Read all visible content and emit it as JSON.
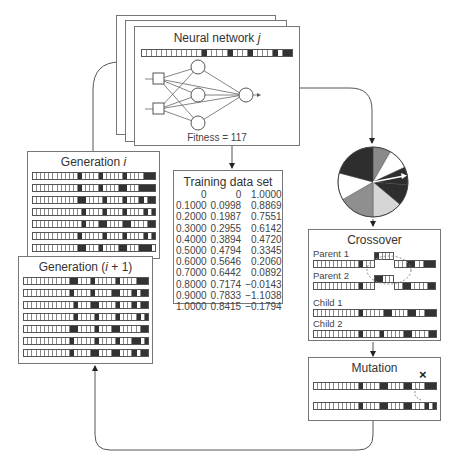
{
  "neural_network": {
    "title": "Neural network j",
    "title_prefix": "Neural network ",
    "title_var": "j",
    "fitness_label": "Fitness = 117",
    "chromosome": [
      0,
      0,
      0,
      0,
      0,
      0,
      0,
      0,
      0,
      0,
      0,
      0,
      1,
      0,
      0,
      0,
      0,
      1,
      0,
      0,
      0,
      1,
      0,
      0,
      0,
      0,
      1,
      0,
      1,
      1
    ]
  },
  "training_data": {
    "title": "Training data set",
    "rows": [
      [
        "0",
        "0",
        "1.0000"
      ],
      [
        "0.1000",
        "0.0998",
        "0.8869"
      ],
      [
        "0.2000",
        "0.1987",
        "0.7551"
      ],
      [
        "0.3000",
        "0.2955",
        "0.6142"
      ],
      [
        "0.4000",
        "0.3894",
        "0.4720"
      ],
      [
        "0.5000",
        "0.4794",
        "0.3345"
      ],
      [
        "0.6000",
        "0.5646",
        "0.2060"
      ],
      [
        "0.7000",
        "0.6442",
        "0.0892"
      ],
      [
        "0.8000",
        "0.7174",
        "−0.0143"
      ],
      [
        "0.9000",
        "0.7833",
        "−1.1038"
      ],
      [
        "1.0000",
        "0.8415",
        "−0.1794"
      ]
    ]
  },
  "generation_i": {
    "title_prefix": "Generation ",
    "title_var": "i",
    "title_suffix": "",
    "rows": [
      [
        0,
        0,
        0,
        0,
        0,
        0,
        0,
        0,
        0,
        0,
        0,
        1,
        0,
        0,
        0,
        0,
        1,
        0,
        0,
        0,
        0,
        0,
        1,
        0,
        0,
        0,
        0,
        1,
        1,
        1
      ],
      [
        0,
        0,
        0,
        0,
        0,
        0,
        0,
        0,
        0,
        0,
        0,
        1,
        0,
        0,
        0,
        0,
        1,
        0,
        0,
        0,
        0,
        1,
        1,
        0,
        0,
        0,
        1,
        1,
        1,
        1
      ],
      [
        0,
        0,
        0,
        0,
        0,
        0,
        0,
        0,
        0,
        0,
        0,
        1,
        1,
        0,
        0,
        0,
        0,
        1,
        0,
        0,
        0,
        0,
        1,
        0,
        0,
        0,
        1,
        0,
        1,
        1
      ],
      [
        0,
        0,
        0,
        0,
        0,
        0,
        0,
        0,
        0,
        0,
        0,
        0,
        1,
        0,
        0,
        0,
        0,
        1,
        0,
        0,
        0,
        0,
        1,
        0,
        0,
        0,
        0,
        1,
        0,
        1
      ],
      [
        0,
        0,
        0,
        0,
        0,
        0,
        0,
        0,
        0,
        0,
        0,
        0,
        1,
        0,
        0,
        0,
        1,
        1,
        0,
        0,
        0,
        0,
        1,
        1,
        0,
        0,
        0,
        0,
        1,
        1
      ],
      [
        0,
        0,
        0,
        0,
        0,
        0,
        0,
        0,
        0,
        0,
        0,
        1,
        0,
        0,
        0,
        0,
        0,
        1,
        0,
        0,
        0,
        0,
        1,
        0,
        0,
        0,
        0,
        1,
        0,
        1
      ],
      [
        0,
        0,
        0,
        0,
        0,
        0,
        0,
        0,
        0,
        0,
        0,
        1,
        1,
        0,
        0,
        0,
        1,
        0,
        0,
        0,
        0,
        1,
        1,
        0,
        0,
        0,
        1,
        1,
        1,
        0
      ]
    ]
  },
  "generation_i1": {
    "title_prefix": "Generation (",
    "title_var": "i",
    "title_suffix": " + 1)",
    "rows": [
      [
        0,
        0,
        0,
        0,
        0,
        0,
        0,
        0,
        0,
        0,
        0,
        1,
        1,
        0,
        0,
        0,
        1,
        0,
        0,
        0,
        0,
        0,
        1,
        0,
        0,
        0,
        0,
        1,
        1,
        1
      ],
      [
        0,
        0,
        0,
        0,
        0,
        0,
        0,
        0,
        0,
        0,
        0,
        1,
        0,
        0,
        0,
        0,
        1,
        0,
        0,
        0,
        0,
        1,
        1,
        0,
        0,
        0,
        1,
        0,
        1,
        1
      ],
      [
        0,
        0,
        0,
        0,
        0,
        0,
        0,
        0,
        0,
        0,
        0,
        0,
        1,
        0,
        0,
        0,
        1,
        1,
        0,
        0,
        0,
        0,
        1,
        0,
        0,
        0,
        1,
        0,
        1,
        1
      ],
      [
        0,
        0,
        0,
        0,
        0,
        0,
        0,
        0,
        0,
        0,
        0,
        0,
        1,
        0,
        0,
        0,
        0,
        1,
        0,
        0,
        0,
        0,
        1,
        0,
        0,
        0,
        0,
        1,
        0,
        1
      ],
      [
        0,
        0,
        0,
        0,
        0,
        0,
        0,
        0,
        0,
        0,
        0,
        1,
        1,
        0,
        0,
        0,
        0,
        1,
        0,
        0,
        0,
        1,
        1,
        0,
        0,
        0,
        0,
        0,
        1,
        1
      ],
      [
        0,
        0,
        0,
        0,
        0,
        0,
        0,
        0,
        0,
        0,
        0,
        1,
        0,
        0,
        0,
        0,
        0,
        1,
        0,
        0,
        0,
        0,
        1,
        0,
        0,
        0,
        1,
        1,
        0,
        1
      ],
      [
        0,
        0,
        0,
        0,
        0,
        0,
        0,
        0,
        0,
        0,
        0,
        1,
        0,
        0,
        0,
        0,
        1,
        1,
        0,
        0,
        0,
        1,
        1,
        0,
        0,
        0,
        1,
        0,
        1,
        1
      ]
    ]
  },
  "roulette_wheel": {
    "label": "Roulette wheel selection",
    "slices": [
      {
        "start": -90,
        "end": -60,
        "color": "#8a8a8a"
      },
      {
        "start": -60,
        "end": -25,
        "color": "#ffffff"
      },
      {
        "start": -25,
        "end": 5,
        "color": "#2e2e2e"
      },
      {
        "start": 5,
        "end": 40,
        "color": "#2e2e2e"
      },
      {
        "start": 40,
        "end": 90,
        "color": "#d6d6d6"
      },
      {
        "start": 90,
        "end": 150,
        "color": "#8f8f8f"
      },
      {
        "start": 150,
        "end": 195,
        "color": "#ffffff"
      },
      {
        "start": 195,
        "end": 270,
        "color": "#2e2e2e"
      }
    ]
  },
  "crossover": {
    "title": "Crossover",
    "parent1_label": "Parent 1",
    "parent2_label": "Parent 2",
    "child1_label": "Child 1",
    "child2_label": "Child 2",
    "child1": [
      0,
      0,
      0,
      0,
      0,
      0,
      0,
      0,
      0,
      0,
      0,
      1,
      0,
      0,
      0,
      0,
      0,
      1,
      1,
      0,
      0,
      0,
      0,
      1,
      1,
      0,
      0,
      1,
      1,
      1
    ],
    "child2": [
      0,
      0,
      0,
      0,
      0,
      0,
      0,
      0,
      0,
      0,
      0,
      1,
      0,
      0,
      0,
      0,
      1,
      0,
      0,
      0,
      0,
      0,
      1,
      1,
      0,
      0,
      0,
      0,
      1,
      1
    ]
  },
  "mutation": {
    "title": "Mutation",
    "mark": "×",
    "before": [
      0,
      0,
      0,
      0,
      0,
      0,
      0,
      0,
      0,
      0,
      0,
      1,
      0,
      0,
      0,
      0,
      1,
      1,
      0,
      0,
      0,
      0,
      1,
      1,
      0,
      0,
      0,
      1,
      1,
      1
    ],
    "after": [
      0,
      0,
      0,
      0,
      0,
      0,
      0,
      0,
      0,
      0,
      0,
      1,
      0,
      0,
      0,
      0,
      1,
      1,
      0,
      0,
      0,
      0,
      1,
      1,
      0,
      0,
      0,
      1,
      0,
      1
    ]
  }
}
